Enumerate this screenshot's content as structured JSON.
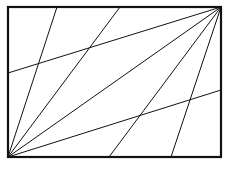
{
  "diagram": {
    "width": 227,
    "height": 169,
    "background": "#ffffff",
    "stroke_color": "#111111",
    "rectangle": {
      "x": 8,
      "y": 7,
      "width": 213,
      "height": 150,
      "stroke_width": 2.2
    },
    "line_width": 1,
    "lines": [
      {
        "name": "bl-to-top-1",
        "x1": 8,
        "y1": 157,
        "x2": 57,
        "y2": 7
      },
      {
        "name": "bl-to-top-2",
        "x1": 8,
        "y1": 157,
        "x2": 120,
        "y2": 7
      },
      {
        "name": "bl-to-tr-diagonal",
        "x1": 8,
        "y1": 157,
        "x2": 221,
        "y2": 7
      },
      {
        "name": "bl-to-right",
        "x1": 8,
        "y1": 157,
        "x2": 221,
        "y2": 90
      },
      {
        "name": "tr-to-left",
        "x1": 221,
        "y1": 7,
        "x2": 8,
        "y2": 73
      },
      {
        "name": "tr-to-bottom-1",
        "x1": 221,
        "y1": 7,
        "x2": 109,
        "y2": 157
      },
      {
        "name": "tr-to-bottom-2",
        "x1": 221,
        "y1": 7,
        "x2": 171,
        "y2": 157
      }
    ]
  }
}
